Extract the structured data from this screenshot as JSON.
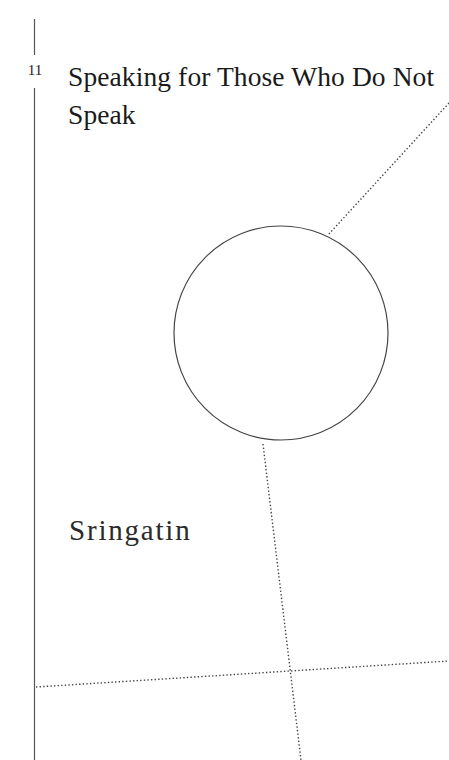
{
  "chapter": {
    "number": "11",
    "title": "Speaking for Those Who Do Not Speak",
    "author": "Sringatin"
  },
  "colors": {
    "background": "#ffffff",
    "text": "#1a1a1a",
    "rule": "#555555",
    "dots": "#444444"
  }
}
